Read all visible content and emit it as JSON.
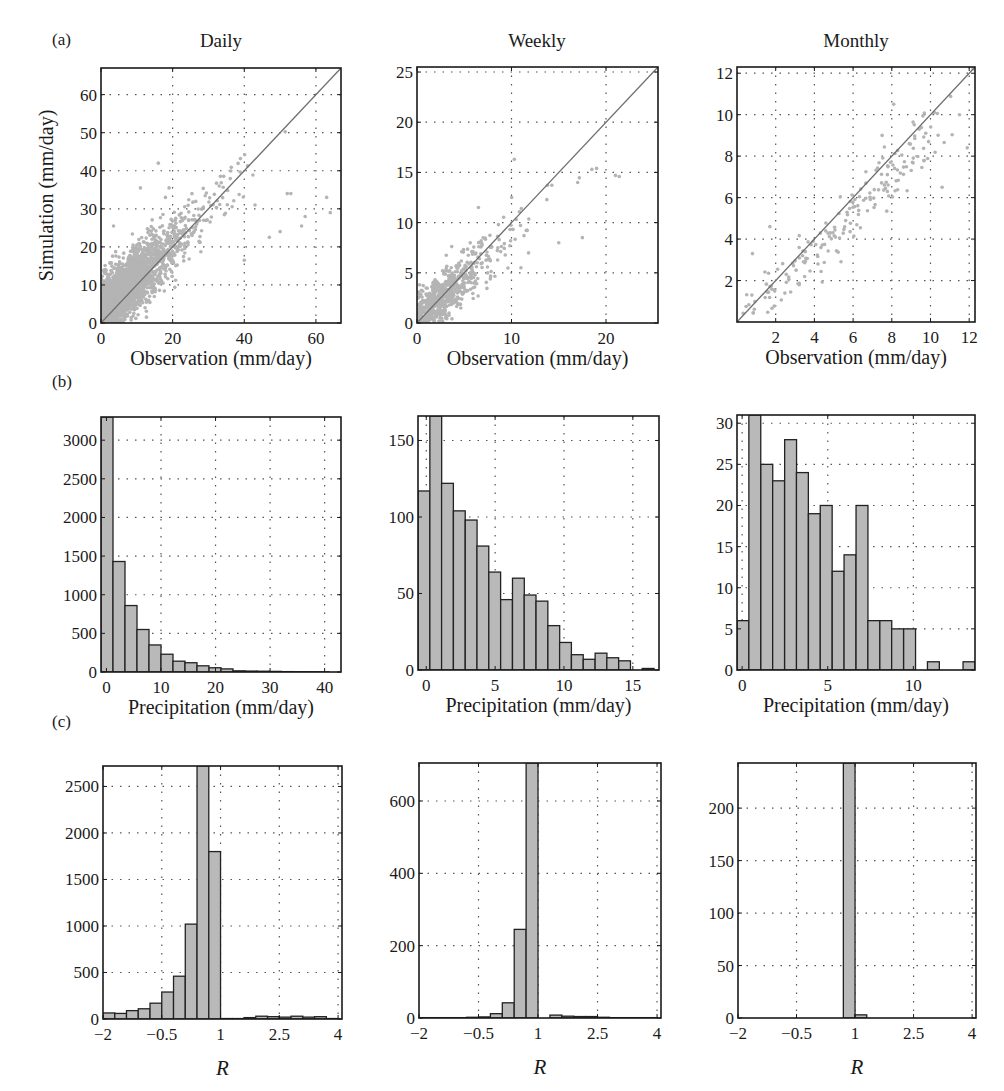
{
  "figure": {
    "panel_labels": [
      "(a)",
      "(b)",
      "(c)"
    ],
    "column_titles": [
      "Daily",
      "Weekly",
      "Monthly"
    ],
    "colors": {
      "axis": "#1a1a1a",
      "grid": "#555555",
      "scatter": "#b4b4b4",
      "one_to_one_line": "#6e6e6e",
      "bar_fill": "#b9b9b9",
      "bar_edge": "#222222"
    }
  },
  "chart_data": [
    {
      "id": "a-daily",
      "row": "a",
      "column": "Daily",
      "type": "scatter",
      "title": "",
      "xlabel": "Observation (mm/day)",
      "ylabel": "Simulation (mm/day)",
      "xlim": [
        0,
        67
      ],
      "ylim": [
        0,
        67
      ],
      "xticks": [
        0,
        20,
        40,
        60
      ],
      "yticks": [
        0,
        10,
        20,
        30,
        40,
        50,
        60
      ],
      "grid": true,
      "one_to_one_line": true,
      "point_cloud": {
        "n_approx": 5500,
        "x_center_range": [
          0,
          30
        ],
        "y_center_range": [
          0,
          25
        ],
        "notable_points": [
          [
            16,
            42
          ],
          [
            11,
            35.5
          ],
          [
            19,
            35.5
          ],
          [
            33,
            36
          ],
          [
            52,
            34
          ],
          [
            53,
            34
          ],
          [
            43,
            31
          ],
          [
            57,
            28
          ],
          [
            63,
            33
          ],
          [
            47,
            22.5
          ],
          [
            50,
            24
          ],
          [
            56,
            25.5
          ],
          [
            64,
            29
          ],
          [
            3.5,
            25.5
          ],
          [
            40,
            16.5
          ]
        ]
      }
    },
    {
      "id": "a-weekly",
      "row": "a",
      "column": "Weekly",
      "type": "scatter",
      "title": "",
      "xlabel": "Observation (mm/day)",
      "ylabel": "",
      "xlim": [
        0,
        25.5
      ],
      "ylim": [
        0,
        25.5
      ],
      "xticks": [
        0,
        10,
        20
      ],
      "yticks": [
        0,
        5,
        10,
        15,
        20,
        25
      ],
      "grid": true,
      "one_to_one_line": true,
      "point_cloud": {
        "n_approx": 780,
        "x_center_range": [
          0,
          12
        ],
        "y_center_range": [
          0,
          12
        ],
        "notable_points": [
          [
            10.3,
            16.3
          ],
          [
            19,
            15.4
          ],
          [
            18.5,
            15.3
          ],
          [
            21,
            14.7
          ],
          [
            21.4,
            14.6
          ],
          [
            17,
            14
          ],
          [
            15,
            8
          ],
          [
            17.5,
            8.5
          ],
          [
            11,
            5.5
          ],
          [
            6.5,
            11.5
          ]
        ]
      }
    },
    {
      "id": "a-monthly",
      "row": "a",
      "column": "Monthly",
      "type": "scatter",
      "title": "",
      "xlabel": "Observation (mm/day)",
      "ylabel": "",
      "xlim": [
        0,
        12.3
      ],
      "ylim": [
        0,
        12.3
      ],
      "xticks": [
        2,
        4,
        6,
        8,
        10,
        12
      ],
      "yticks": [
        2,
        4,
        6,
        8,
        10,
        12
      ],
      "grid": true,
      "one_to_one_line": true,
      "point_cloud": {
        "n_approx": 190,
        "x_center_range": [
          0,
          12
        ],
        "y_center_range": [
          0,
          12
        ],
        "notable_points": [
          [
            8.1,
            10.5
          ],
          [
            10.2,
            10.1
          ],
          [
            11.5,
            10
          ],
          [
            11.9,
            8.4
          ],
          [
            10.6,
            6.5
          ],
          [
            0.8,
            3.3
          ],
          [
            1.7,
            4.6
          ],
          [
            9.9,
            8.7
          ],
          [
            7.5,
            9
          ],
          [
            12.2,
            12.2
          ]
        ]
      }
    },
    {
      "id": "b-daily",
      "row": "b",
      "column": "Daily",
      "type": "bar",
      "title": "",
      "xlabel": "Precipitation (mm/day)",
      "ylabel": "",
      "xlim": [
        -1,
        43
      ],
      "ylim": [
        0,
        3300
      ],
      "xticks": [
        0,
        10,
        20,
        30,
        40
      ],
      "yticks": [
        0,
        500,
        1000,
        1500,
        2000,
        2500,
        3000
      ],
      "grid": true,
      "bin_width": 2.2,
      "bin_centers": [
        0.1,
        2.3,
        4.5,
        6.7,
        8.9,
        11.1,
        13.3,
        15.5,
        17.7,
        19.9,
        22.1,
        24.3,
        26.5,
        28.7,
        30.9,
        33.1,
        35.3,
        37.5,
        39.7
      ],
      "values": [
        3300,
        1430,
        860,
        550,
        350,
        230,
        140,
        120,
        80,
        55,
        40,
        15,
        12,
        10,
        8,
        5,
        4,
        3,
        2
      ]
    },
    {
      "id": "b-weekly",
      "row": "b",
      "column": "Weekly",
      "type": "bar",
      "title": "",
      "xlabel": "Precipitation (mm/day)",
      "ylabel": "",
      "xlim": [
        -0.6,
        16.9
      ],
      "ylim": [
        0,
        166
      ],
      "xticks": [
        0,
        5,
        10,
        15
      ],
      "yticks": [
        0,
        50,
        100,
        150
      ],
      "grid": true,
      "bin_width": 0.857,
      "bin_centers": [
        -0.17,
        0.69,
        1.54,
        2.4,
        3.26,
        4.11,
        4.97,
        5.83,
        6.69,
        7.54,
        8.4,
        9.26,
        10.11,
        10.97,
        11.83,
        12.69,
        13.54,
        14.4,
        15.26,
        16.11
      ],
      "values": [
        117,
        166,
        122,
        104,
        98,
        81,
        64,
        46,
        60,
        49,
        45,
        29,
        18,
        10,
        7,
        11,
        8,
        6,
        0,
        1
      ]
    },
    {
      "id": "b-monthly",
      "row": "b",
      "column": "Monthly",
      "type": "bar",
      "title": "",
      "xlabel": "Precipitation (mm/day)",
      "ylabel": "",
      "xlim": [
        -0.3,
        13.6
      ],
      "ylim": [
        0,
        31
      ],
      "xticks": [
        0,
        5,
        10
      ],
      "yticks": [
        0,
        5,
        10,
        15,
        20,
        25,
        30
      ],
      "grid": true,
      "bin_width": 0.695,
      "bin_centers": [
        0.05,
        0.74,
        1.44,
        2.13,
        2.83,
        3.52,
        4.22,
        4.91,
        5.61,
        6.3,
        7.0,
        7.69,
        8.39,
        9.08,
        9.78,
        10.47,
        11.17,
        11.86,
        12.56,
        13.25
      ],
      "values": [
        6,
        31,
        25,
        23,
        28,
        24,
        19,
        20,
        12,
        14,
        20,
        6,
        6,
        5,
        5,
        0,
        1,
        0,
        0,
        1
      ]
    },
    {
      "id": "c-daily",
      "row": "c",
      "column": "Daily",
      "type": "bar",
      "title": "",
      "xlabel": "R",
      "ylabel": "",
      "xlim": [
        -2,
        4.1
      ],
      "ylim": [
        0,
        2720
      ],
      "xticks": [
        -2,
        -0.5,
        1,
        2.5,
        4
      ],
      "xtick_labels": [
        "−2",
        "−0.5",
        "1",
        "2.5",
        "4"
      ],
      "yticks": [
        0,
        500,
        1000,
        1500,
        2000,
        2500
      ],
      "grid": true,
      "bin_width": 0.3,
      "bin_centers": [
        -1.85,
        -1.55,
        -1.25,
        -0.95,
        -0.65,
        -0.35,
        -0.05,
        0.25,
        0.55,
        0.85,
        1.15,
        1.45,
        1.75,
        2.05,
        2.35,
        2.65,
        2.95,
        3.25,
        3.55,
        3.85
      ],
      "values": [
        65,
        60,
        90,
        110,
        170,
        290,
        460,
        1020,
        2720,
        1800,
        5,
        5,
        15,
        30,
        25,
        20,
        30,
        20,
        25,
        5
      ]
    },
    {
      "id": "c-weekly",
      "row": "c",
      "column": "Weekly",
      "type": "bar",
      "title": "",
      "xlabel": "R",
      "ylabel": "",
      "xlim": [
        -2,
        4.1
      ],
      "ylim": [
        0,
        705
      ],
      "xticks": [
        -2,
        -0.5,
        1,
        2.5,
        4
      ],
      "xtick_labels": [
        "−2",
        "−0.5",
        "1",
        "2.5",
        "4"
      ],
      "yticks": [
        0,
        200,
        400,
        600
      ],
      "grid": true,
      "bin_width": 0.3,
      "bin_centers": [
        -1.85,
        -1.55,
        -1.25,
        -0.95,
        -0.65,
        -0.35,
        -0.05,
        0.25,
        0.55,
        0.85,
        1.15,
        1.45,
        1.75,
        2.05,
        2.35,
        2.65,
        2.95,
        3.25,
        3.55,
        3.85
      ],
      "values": [
        1,
        1,
        1,
        1,
        2,
        3,
        12,
        42,
        245,
        705,
        0,
        8,
        5,
        4,
        4,
        2,
        1,
        1,
        1,
        1
      ]
    },
    {
      "id": "c-monthly",
      "row": "c",
      "column": "Monthly",
      "type": "bar",
      "title": "",
      "xlabel": "R",
      "ylabel": "",
      "xlim": [
        -2,
        4.1
      ],
      "ylim": [
        0,
        243
      ],
      "xticks": [
        -2,
        -0.5,
        1,
        2.5,
        4
      ],
      "xtick_labels": [
        "−2",
        "−0.5",
        "1",
        "2.5",
        "4"
      ],
      "yticks": [
        0,
        50,
        100,
        150,
        200
      ],
      "grid": true,
      "bin_width": 0.3,
      "bin_centers": [
        -1.85,
        -1.55,
        -1.25,
        -0.95,
        -0.65,
        -0.35,
        -0.05,
        0.25,
        0.55,
        0.85,
        1.15,
        1.45,
        1.75,
        2.05,
        2.35,
        2.65,
        2.95,
        3.25,
        3.55,
        3.85
      ],
      "values": [
        0,
        0,
        0,
        0,
        0,
        0,
        0,
        0,
        0,
        243,
        3,
        0,
        0,
        0,
        0,
        0,
        0,
        0,
        0,
        0
      ]
    }
  ]
}
